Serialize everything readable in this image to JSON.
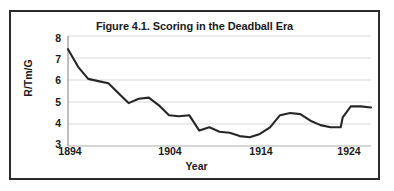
{
  "figure": {
    "title": "Figure 4.1. Scoring in the Deadball Era"
  },
  "axes": {
    "y_title": "R/Tm/G",
    "x_title": "Year",
    "y_ticks": [
      "8",
      "7",
      "6",
      "5",
      "4",
      "3"
    ],
    "x_ticks": [
      "1894",
      "1904",
      "1914",
      "1924"
    ]
  },
  "chart_data": {
    "type": "line",
    "title": "Figure 4.1. Scoring in the Deadball Era",
    "xlabel": "Year",
    "ylabel": "R/Tm/G",
    "xlim": [
      1894,
      1924
    ],
    "ylim": [
      3,
      8
    ],
    "ytick_values": [
      8,
      7,
      6,
      5,
      4,
      3
    ],
    "xtick_values": [
      1894,
      1904,
      1914,
      1924
    ],
    "grid": "horizontal",
    "legend": "none",
    "line_color": "#262626",
    "x": [
      1894,
      1895,
      1896,
      1897,
      1898,
      1899,
      1900,
      1901,
      1902,
      1903,
      1904,
      1905,
      1906,
      1907,
      1908,
      1909,
      1910,
      1911,
      1912,
      1913,
      1914,
      1915,
      1916,
      1917,
      1918,
      1919,
      1920,
      1921,
      1922,
      1923,
      1924
    ],
    "y": [
      7.4,
      6.6,
      6.05,
      5.95,
      5.85,
      5.4,
      4.95,
      5.15,
      5.2,
      4.85,
      4.4,
      4.35,
      4.4,
      3.7,
      3.85,
      3.65,
      3.6,
      3.45,
      3.4,
      3.55,
      3.85,
      4.4,
      4.5,
      4.45,
      4.15,
      3.95,
      3.85,
      3.85,
      3.6,
      3.6,
      3.7
    ],
    "y_extended": [
      4.3,
      4.8,
      4.8,
      4.78,
      4.75
    ],
    "series": [
      {
        "name": "R/Tm/G",
        "values": [
          7.4,
          6.6,
          6.05,
          5.95,
          5.85,
          5.4,
          4.95,
          5.15,
          5.2,
          4.85,
          4.4,
          4.35,
          4.4,
          3.7,
          3.85,
          3.65,
          3.6,
          3.45,
          3.4,
          3.55,
          3.85,
          4.4,
          4.5,
          4.45,
          4.15,
          3.95,
          3.85,
          3.85,
          3.6,
          3.6,
          4.3
        ]
      }
    ],
    "points": [
      {
        "year": 1894,
        "value": 7.4
      },
      {
        "year": 1895,
        "value": 6.6
      },
      {
        "year": 1896,
        "value": 6.05
      },
      {
        "year": 1897,
        "value": 5.95
      },
      {
        "year": 1898,
        "value": 5.85
      },
      {
        "year": 1899,
        "value": 5.4
      },
      {
        "year": 1900,
        "value": 4.95
      },
      {
        "year": 1901,
        "value": 5.15
      },
      {
        "year": 1902,
        "value": 5.2
      },
      {
        "year": 1903,
        "value": 4.85
      },
      {
        "year": 1904,
        "value": 4.4
      },
      {
        "year": 1905,
        "value": 4.35
      },
      {
        "year": 1906,
        "value": 4.4
      },
      {
        "year": 1907,
        "value": 3.7
      },
      {
        "year": 1908,
        "value": 3.85
      },
      {
        "year": 1909,
        "value": 3.65
      },
      {
        "year": 1910,
        "value": 3.6
      },
      {
        "year": 1911,
        "value": 3.45
      },
      {
        "year": 1912,
        "value": 3.4
      },
      {
        "year": 1913,
        "value": 3.55
      },
      {
        "year": 1914,
        "value": 3.85
      },
      {
        "year": 1915,
        "value": 4.4
      },
      {
        "year": 1916,
        "value": 4.5
      },
      {
        "year": 1917,
        "value": 4.45
      },
      {
        "year": 1918,
        "value": 4.15
      },
      {
        "year": 1919,
        "value": 3.95
      },
      {
        "year": 1920,
        "value": 3.85
      },
      {
        "year": 1921,
        "value": 3.85
      },
      {
        "year": 1922,
        "value": 3.6
      },
      {
        "year": 1923,
        "value": 3.6
      },
      {
        "year": 1924,
        "value": 4.3
      }
    ]
  }
}
